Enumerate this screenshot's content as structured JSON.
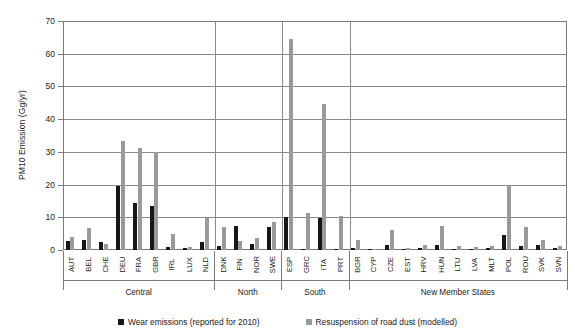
{
  "chart_data": {
    "type": "bar",
    "title": "",
    "xlabel": "",
    "ylabel": "PM10 Emission (Gg/yr)",
    "ylim": [
      0,
      70
    ],
    "ytick_values": [
      0,
      10,
      20,
      30,
      40,
      50,
      60,
      70
    ],
    "ytick_labels": [
      "0",
      "10",
      "20",
      "30",
      "40",
      "50",
      "60",
      "70"
    ],
    "grid": true,
    "legend_position": "bottom",
    "categories": [
      "AUT",
      "BEL",
      "CHE",
      "DEU",
      "FRA",
      "GBR",
      "IRL",
      "LUX",
      "NLD",
      "DNK",
      "FIN",
      "NOR",
      "SWE",
      "ESP",
      "GRC",
      "ITA",
      "PRT",
      "BGR",
      "CYP",
      "CZE",
      "EST",
      "HRV",
      "HUN",
      "LTU",
      "LVA",
      "MLT",
      "POL",
      "ROU",
      "SVK",
      "SVN"
    ],
    "series": [
      {
        "name": "Wear emissions (reported for 2010)",
        "color": "#171717",
        "values": [
          2.7,
          3.2,
          2.6,
          19.6,
          14.3,
          13.6,
          0.8,
          0.5,
          2.3,
          1.2,
          7.3,
          1.8,
          6.9,
          10.1,
          0.3,
          9.9,
          0.2,
          0.6,
          0.2,
          1.5,
          0.4,
          0.7,
          1.6,
          0.3,
          0.3,
          0.7,
          4.5,
          1.1,
          1.4,
          0.5
        ]
      },
      {
        "name": "Resuspension of road dust (modelled)",
        "color": "#9a9a9a",
        "values": [
          3.9,
          6.6,
          1.7,
          33.2,
          31.2,
          30.0,
          5.0,
          0.8,
          9.8,
          6.9,
          2.9,
          3.6,
          8.7,
          64.5,
          11.3,
          44.5,
          10.5,
          3.2,
          0.4,
          6.2,
          0.5,
          1.6,
          7.3,
          1.1,
          0.9,
          1.2,
          19.9,
          7.0,
          3.2,
          1.3
        ]
      }
    ],
    "groups": [
      {
        "label": "Central",
        "countries": [
          "AUT",
          "BEL",
          "CHE",
          "DEU",
          "FRA",
          "GBR",
          "IRL",
          "LUX",
          "NLD"
        ]
      },
      {
        "label": "North",
        "countries": [
          "DNK",
          "FIN",
          "NOR",
          "SWE"
        ]
      },
      {
        "label": "South",
        "countries": [
          "ESP",
          "GRC",
          "ITA",
          "PRT"
        ]
      },
      {
        "label": "New Member States",
        "countries": [
          "BGR",
          "CYP",
          "CZE",
          "EST",
          "HRV",
          "HUN",
          "LTU",
          "LVA",
          "MLT",
          "POL",
          "ROU",
          "SVK",
          "SVN"
        ]
      }
    ]
  }
}
